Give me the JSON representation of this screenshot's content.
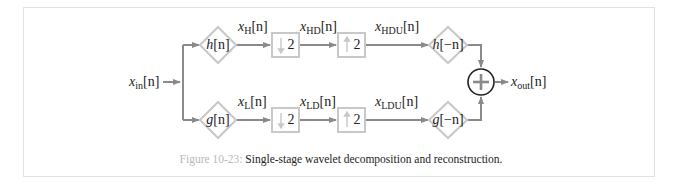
{
  "figure": {
    "number_label": "Figure 10-23:",
    "caption_text": " Single-stage wavelet decomposition and reconstruction."
  },
  "colors": {
    "line": "#8a8a8a",
    "block_border": "#c8c8c8",
    "text": "#222222",
    "caption_number": "#b8b8b8",
    "frame_border": "#e2e2e2",
    "summer_border": "#222222"
  },
  "signals": {
    "input": {
      "base": "x",
      "sub": "in",
      "arg": "[n]"
    },
    "output": {
      "base": "x",
      "sub": "out",
      "arg": "[n]"
    },
    "high": [
      {
        "base": "x",
        "sub": "H",
        "arg": "[n]"
      },
      {
        "base": "x",
        "sub": "HD",
        "arg": "[n]"
      },
      {
        "base": "x",
        "sub": "HDU",
        "arg": "[n]"
      }
    ],
    "low": [
      {
        "base": "x",
        "sub": "L",
        "arg": "[n]"
      },
      {
        "base": "x",
        "sub": "LD",
        "arg": "[n]"
      },
      {
        "base": "x",
        "sub": "LDU",
        "arg": "[n]"
      }
    ]
  },
  "blocks": {
    "high_analysis": {
      "fn": "h",
      "arg": "[n]"
    },
    "high_synthesis": {
      "fn": "h",
      "arg": "[−n]"
    },
    "low_analysis": {
      "fn": "g",
      "arg": "[n]"
    },
    "low_synthesis": {
      "fn": "g",
      "arg": "[−n]"
    },
    "downsample": {
      "arrow": "↓",
      "factor": "2"
    },
    "upsample": {
      "arrow": "↑",
      "factor": "2"
    },
    "summer": {
      "symbol": "+"
    }
  }
}
